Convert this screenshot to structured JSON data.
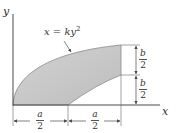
{
  "figure": {
    "axes": {
      "x_label": "x",
      "y_label": "y"
    },
    "curve_label": {
      "lhs": "x",
      "eq": " = ",
      "rhs_base": "ky",
      "rhs_exp": "2"
    },
    "dimensions": {
      "vertical": [
        {
          "numerator": "b",
          "denominator": "2"
        },
        {
          "numerator": "b",
          "denominator": "2"
        }
      ],
      "horizontal": [
        {
          "numerator": "a",
          "denominator": "2"
        },
        {
          "numerator": "a",
          "denominator": "2"
        }
      ]
    },
    "colors": {
      "region_fill": "#c8c8c8",
      "region_edge": "#8a8a8a",
      "line": "#4a4a4a",
      "text": "#333333"
    }
  }
}
